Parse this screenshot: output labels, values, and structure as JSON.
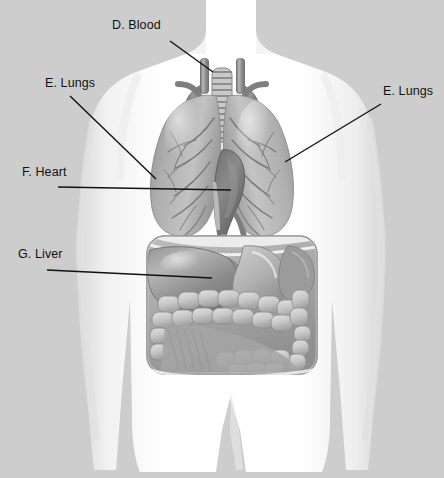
{
  "figure": {
    "kind": "anatomy-diagram",
    "background_color": "#cdcdcd",
    "body_color": "#ffffff",
    "organ_color": "#a8a8a8",
    "label_color": "#111111",
    "leader_line_color": "#111111"
  },
  "labels": [
    {
      "id": "blood",
      "text": "D. Blood",
      "x": 112,
      "y": 26,
      "anchor": "start",
      "leader": {
        "x1": 170,
        "y1": 41,
        "x2": 213,
        "y2": 72
      }
    },
    {
      "id": "lungs_left",
      "text": "E. Lungs",
      "x": 45,
      "y": 84,
      "anchor": "start",
      "leader": {
        "x1": 70,
        "y1": 96,
        "x2": 156,
        "y2": 179
      }
    },
    {
      "id": "lungs_right",
      "text": "E. Lungs",
      "x": 383,
      "y": 92,
      "anchor": "start",
      "leader": {
        "x1": 381,
        "y1": 104,
        "x2": 285,
        "y2": 162
      }
    },
    {
      "id": "heart",
      "text": "F. Heart",
      "x": 22,
      "y": 173,
      "anchor": "start",
      "leader": {
        "x1": 58,
        "y1": 187,
        "x2": 231,
        "y2": 190
      }
    },
    {
      "id": "liver",
      "text": "G. Liver",
      "x": 18,
      "y": 255,
      "anchor": "start",
      "leader": {
        "x1": 47,
        "y1": 270,
        "x2": 212,
        "y2": 278
      }
    }
  ],
  "organs": [
    {
      "name": "blood-vessels",
      "label_key": "blood",
      "region": "superior mediastinum"
    },
    {
      "name": "left-lung",
      "label_key": "lungs_left",
      "region": "thoracic cavity"
    },
    {
      "name": "right-lung",
      "label_key": "lungs_right",
      "region": "thoracic cavity"
    },
    {
      "name": "heart",
      "label_key": "heart",
      "region": "mediastinum"
    },
    {
      "name": "liver",
      "label_key": "liver",
      "region": "abdominal cavity"
    },
    {
      "name": "trachea",
      "label_key": null,
      "region": "neck"
    },
    {
      "name": "stomach",
      "label_key": null,
      "region": "abdominal cavity"
    },
    {
      "name": "intestines",
      "label_key": null,
      "region": "abdominal cavity"
    }
  ],
  "cavity": {
    "x": 147,
    "y": 236,
    "width": 170,
    "height": 138,
    "radius": 18
  },
  "trachea": {
    "rings": 12,
    "x": 212,
    "y": 68,
    "width": 20,
    "height": 72
  }
}
